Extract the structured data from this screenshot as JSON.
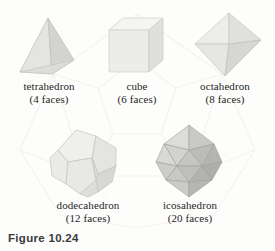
{
  "figure": {
    "caption": "Figure 10.24",
    "background_color": "#fdfdfc"
  },
  "solids": [
    {
      "id": "tetrahedron",
      "name": "tetrahedron",
      "faces_label": "(4 faces)",
      "faces": 4,
      "icon": "tetrahedron-icon",
      "colors": {
        "light": "#e9e9e7",
        "mid": "#dcdcda",
        "dark": "#cfcfcd",
        "edge": "#b9b9b6"
      }
    },
    {
      "id": "cube",
      "name": "cube",
      "faces_label": "(6 faces)",
      "faces": 6,
      "icon": "cube-icon",
      "colors": {
        "light": "#f2f2f0",
        "mid": "#e8e8e6",
        "dark": "#dedede",
        "edge": "#c9c9c6"
      }
    },
    {
      "id": "octahedron",
      "name": "octahedron",
      "faces_label": "(8 faces)",
      "faces": 8,
      "icon": "octahedron-icon",
      "colors": {
        "light": "#ededeb",
        "mid": "#e2e2e0",
        "dark": "#d6d6d4",
        "edge": "#bdbdba"
      }
    },
    {
      "id": "dodecahedron",
      "name": "dodecahedron",
      "faces_label": "(12 faces)",
      "faces": 12,
      "icon": "dodecahedron-icon",
      "colors": {
        "light": "#eeeeec",
        "mid": "#e3e3e1",
        "dark": "#d4d4d2",
        "edge": "#bcbcb9"
      }
    },
    {
      "id": "icosahedron",
      "name": "icosahedron",
      "faces_label": "(20 faces)",
      "faces": 20,
      "icon": "icosahedron-icon",
      "colors": {
        "light": "#d8d8d6",
        "mid": "#c5c5c3",
        "dark": "#b0b0ae",
        "edge": "#9a9a97"
      }
    }
  ]
}
